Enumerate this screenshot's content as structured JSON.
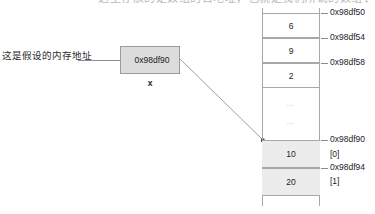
{
  "heading_sliver": "这里存放的是数组的首地址，也就是我们所说的数组名",
  "annotation": {
    "text": "这是假设的内存地址"
  },
  "pointer_box": {
    "value": "0x98df90",
    "variable_name": "x"
  },
  "memory": {
    "cells": [
      {
        "value": "6",
        "shaded": false,
        "top": 13,
        "height": 25
      },
      {
        "value": "9",
        "shaded": false,
        "top": 38,
        "height": 25
      },
      {
        "value": "2",
        "shaded": false,
        "top": 63,
        "height": 25
      },
      {
        "value": "…",
        "shaded": false,
        "top": 95,
        "height": 16,
        "ellipsis": true
      },
      {
        "value": "…",
        "shaded": false,
        "top": 113,
        "height": 16,
        "ellipsis": true
      },
      {
        "value": "10",
        "shaded": true,
        "top": 140,
        "height": 28
      },
      {
        "value": "20",
        "shaded": true,
        "top": 168,
        "height": 28
      }
    ],
    "labels": [
      {
        "text": "0x98df50",
        "y": 13,
        "tick": true
      },
      {
        "text": "0x98df54",
        "y": 38,
        "tick": true
      },
      {
        "text": "0x98df58",
        "y": 63,
        "tick": true
      },
      {
        "text": "0x98df90",
        "y": 140,
        "tick": true
      },
      {
        "text": "[0]",
        "y": 155,
        "tick": false
      },
      {
        "text": "0x98df94",
        "y": 168,
        "tick": true
      },
      {
        "text": "[1]",
        "y": 182,
        "tick": false
      }
    ]
  },
  "colors": {
    "box_fill": "#dcdcdc",
    "box_border": "#9a9a9a",
    "cell_border": "#a8a8a8",
    "cell_shaded": "#ececec",
    "line": "#8e8e8e",
    "text": "#1d1d1d"
  }
}
